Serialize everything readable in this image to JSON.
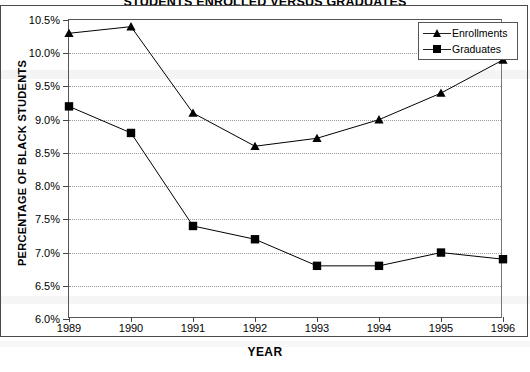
{
  "chart_data": {
    "type": "line",
    "title": "STUDENTS ENROLLED VERSUS GRADUATES",
    "xlabel": "YEAR",
    "ylabel": "PERCENTAGE OF BLACK STUDENTS",
    "categories": [
      "1989",
      "1990",
      "1991",
      "1992",
      "1993",
      "1994",
      "1995",
      "1996"
    ],
    "ylim": [
      6.0,
      10.5
    ],
    "ytick_values": [
      6.0,
      6.5,
      7.0,
      7.5,
      8.0,
      8.5,
      9.0,
      9.5,
      10.0,
      10.5
    ],
    "ytick_labels": [
      "6.0%",
      "6.5%",
      "7.0%",
      "7.5%",
      "8.0%",
      "8.5%",
      "9.0%",
      "9.5%",
      "10.0%",
      "10.5%"
    ],
    "grid": true,
    "grid_style": "dotted",
    "legend_position": "upper right",
    "series": [
      {
        "name": "Enrollments",
        "marker": "triangle",
        "color": "#000000",
        "values": [
          10.3,
          10.4,
          9.1,
          8.6,
          8.72,
          9.0,
          9.4,
          9.9
        ]
      },
      {
        "name": "Graduates",
        "marker": "square",
        "color": "#000000",
        "values": [
          9.2,
          8.8,
          7.4,
          7.2,
          6.8,
          6.8,
          7.0,
          6.9
        ]
      }
    ]
  },
  "legend": {
    "items": [
      {
        "label": "Enrollments",
        "marker": "triangle"
      },
      {
        "label": "Graduates",
        "marker": "square"
      }
    ]
  }
}
